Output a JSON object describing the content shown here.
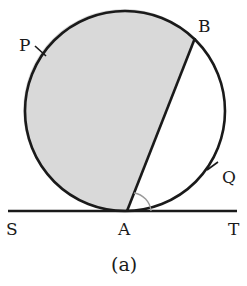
{
  "diagram": {
    "caption": "(a)",
    "points": {
      "P": {
        "label": "P"
      },
      "B": {
        "label": "B"
      },
      "Q": {
        "label": "Q"
      },
      "S": {
        "label": "S"
      },
      "A": {
        "label": "A"
      },
      "T": {
        "label": "T"
      }
    },
    "elements": {
      "circle": "circle with chord AB",
      "chord": "AB",
      "tangent": "SAT tangent to circle at A",
      "shaded_region": "major segment APB (shaded)",
      "marked_angle": "angle BAT"
    },
    "colors": {
      "stroke": "#1a1a1a",
      "shade": "#d9d9d9",
      "angle_arc": "#9a9a9a",
      "background": "#ffffff"
    }
  }
}
